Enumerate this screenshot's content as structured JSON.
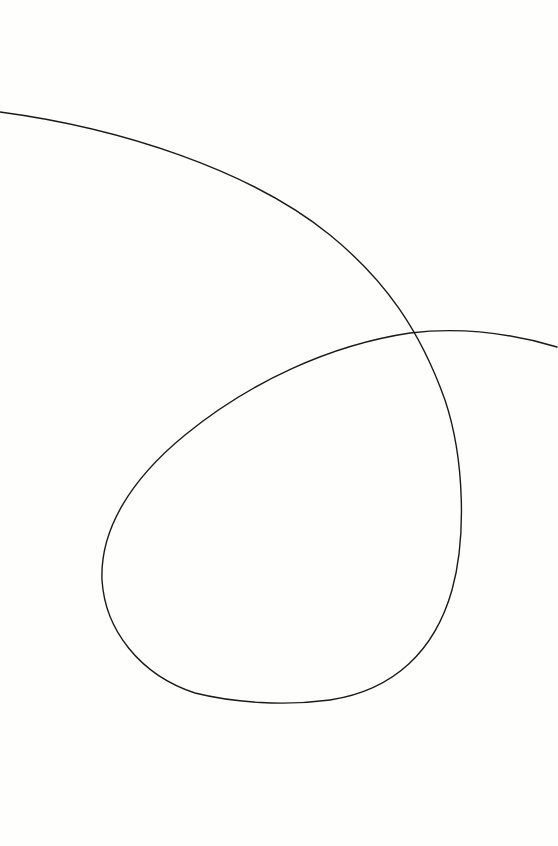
{
  "drawing": {
    "description": "Single continuous hand-drawn line forming a loop on blank paper",
    "background_color": "#fefefc",
    "stroke_color": "#1a1a1a",
    "stroke_width": 1.4,
    "path": "M0,112 C120,128 250,170 330,235 C385,280 420,330 445,400 C465,460 466,540 452,590 C435,650 395,690 330,700 C285,706 235,703 195,693 C140,675 105,630 102,580 C100,530 130,480 185,435 C250,382 330,345 410,333 C460,327 510,333 557,347"
  }
}
